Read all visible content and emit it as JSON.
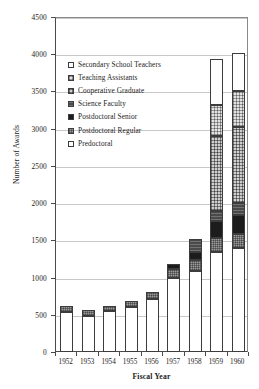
{
  "chart_data": {
    "type": "bar",
    "stacked": true,
    "title": "",
    "xlabel": "Fiscal Year",
    "ylabel": "Number of Awards",
    "categories": [
      "1952",
      "1953",
      "1954",
      "1955",
      "1956",
      "1957",
      "1958",
      "1959",
      "1960"
    ],
    "ylim": [
      0,
      4500
    ],
    "ytick_step": 500,
    "yticks": [
      0,
      500,
      1000,
      1500,
      2000,
      2500,
      3000,
      3500,
      4000,
      4500
    ],
    "grid": true,
    "grid_axis": "y",
    "legend_position": "upper-left-inside",
    "series": [
      {
        "name": "Predoctoral",
        "swatch": "f-predoctoral",
        "values": [
          540,
          490,
          545,
          600,
          710,
          1000,
          1090,
          1350,
          1400
        ]
      },
      {
        "name": "Postdoctoral Regular",
        "swatch": "f-postdoc-regular",
        "values": [
          80,
          70,
          75,
          80,
          100,
          120,
          140,
          180,
          190
        ]
      },
      {
        "name": "Postdoctoral Senior",
        "swatch": "f-postdoc-senior",
        "values": [
          0,
          0,
          0,
          0,
          0,
          60,
          120,
          230,
          250
        ]
      },
      {
        "name": "Science Faculty",
        "swatch": "f-science-faculty",
        "values": [
          0,
          0,
          0,
          0,
          0,
          0,
          170,
          140,
          160
        ]
      },
      {
        "name": "Cooperative Graduate",
        "swatch": "f-coop-graduate",
        "values": [
          0,
          0,
          0,
          0,
          0,
          0,
          0,
          1000,
          1020
        ]
      },
      {
        "name": "Teaching Assistants",
        "swatch": "f-teaching-assistants",
        "values": [
          0,
          0,
          0,
          0,
          0,
          0,
          0,
          420,
          490
        ]
      },
      {
        "name": "Secondary School Teachers",
        "swatch": "f-secondary-teachers",
        "values": [
          0,
          0,
          0,
          0,
          0,
          0,
          0,
          620,
          510
        ]
      }
    ],
    "totals": [
      620,
      560,
      620,
      680,
      810,
      1180,
      1520,
      3940,
      4020
    ]
  },
  "legend": {
    "items": [
      {
        "label": "Secondary School Teachers",
        "swatch": "f-secondary-teachers"
      },
      {
        "label": "Teaching Assistants",
        "swatch": "f-teaching-assistants"
      },
      {
        "label": "Cooperative Graduate",
        "swatch": "f-coop-graduate"
      },
      {
        "label": "Science Faculty",
        "swatch": "f-science-faculty"
      },
      {
        "label": "Postdoctoral Senior",
        "swatch": "f-postdoc-senior"
      },
      {
        "label": "Postdoctoral Regular",
        "swatch": "f-postdoc-regular"
      },
      {
        "label": "Predoctoral",
        "swatch": "f-predoctoral"
      }
    ]
  },
  "colors": {
    "axis": "#4a4a4a",
    "grid": "#c8c8c8",
    "text": "#1a1a1a",
    "background": "#ffffff",
    "bar_outline": "#3c3c3c"
  }
}
